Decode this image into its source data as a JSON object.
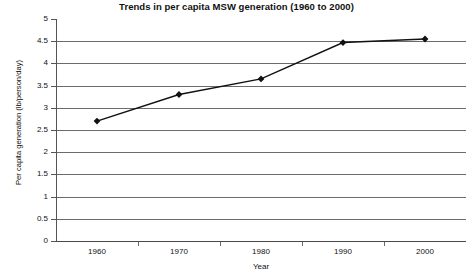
{
  "chart_data": {
    "type": "line",
    "title": "Trends in per capita MSW generation (1960 to 2000)",
    "xlabel": "Year",
    "ylabel": "Per capita generation (lb/person/day)",
    "categories": [
      "1960",
      "1970",
      "1980",
      "1990",
      "2000"
    ],
    "values": [
      2.7,
      3.3,
      3.65,
      4.47,
      4.55
    ],
    "series": [
      {
        "name": "Per capita MSW generation",
        "values": [
          2.7,
          3.3,
          3.65,
          4.47,
          4.55
        ]
      }
    ],
    "ylim": [
      0,
      5
    ],
    "ytick_labels": [
      "0",
      "0.5",
      "1",
      "1.5",
      "2",
      "2.5",
      "3",
      "3.5",
      "4",
      "4.5",
      "5"
    ],
    "ytick_values": [
      0,
      0.5,
      1,
      1.5,
      2,
      2.5,
      3,
      3.5,
      4,
      4.5,
      5
    ],
    "grid": true,
    "legend": "none",
    "marker": "diamond",
    "line_color": "#111111",
    "marker_color": "#111111",
    "grid_color": "#6b6b6b"
  }
}
